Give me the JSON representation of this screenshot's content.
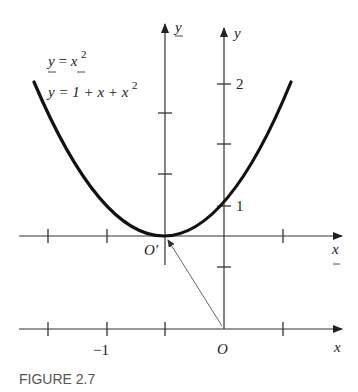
{
  "figure": {
    "caption": "FIGURE 2.7",
    "equations": {
      "shifted": {
        "lhs": "y",
        "eq": "=",
        "rhs": "x",
        "exp": "2"
      },
      "original": {
        "text": "y = 1 + x + x",
        "exp": "2"
      }
    },
    "primed_axes": {
      "x_label": "x",
      "y_label": "y",
      "origin_label": "O′"
    },
    "original_axes": {
      "x_label": "x",
      "y_label": "y",
      "origin_label": "O",
      "x_tick_labels": [
        {
          "value": "−1",
          "at": -1
        }
      ],
      "y_tick_labels": [
        {
          "value": "1",
          "at": 1
        },
        {
          "value": "2",
          "at": 2
        }
      ]
    },
    "curve": {
      "function": "y = 1 + x + x^2",
      "vertex": {
        "x": -0.5,
        "y": 0.75
      },
      "color": "#111111"
    },
    "colors": {
      "ink": "#222222",
      "caption": "#555555",
      "background": "#ffffff"
    }
  }
}
